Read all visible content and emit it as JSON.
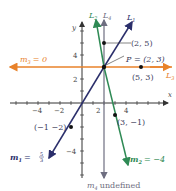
{
  "axes": {
    "x_label": "x",
    "y_label": "y",
    "x_ticks": [
      {
        "value": -4,
        "label": "−4"
      },
      {
        "value": -2,
        "label": "−2"
      },
      {
        "value": 2,
        "label": "2"
      },
      {
        "value": 4,
        "label": "4"
      }
    ],
    "y_ticks": [
      {
        "value": 4,
        "label": "4"
      },
      {
        "value": 2,
        "label": "2"
      },
      {
        "value": -4,
        "label": "−4"
      }
    ]
  },
  "lines": {
    "L1": {
      "name": "L",
      "sub": "1",
      "color": "#2b2f6b",
      "slope_label": "m",
      "slope_sub": "1",
      "slope_value": "= 5/3",
      "slope_num": "5",
      "slope_den": "3"
    },
    "L2": {
      "name": "L",
      "sub": "2",
      "color": "#2f8a55",
      "slope_label": "m",
      "slope_sub": "2",
      "slope_value": "= −4"
    },
    "L3": {
      "name": "L",
      "sub": "3",
      "color": "#e8822a",
      "slope_label": "m",
      "slope_sub": "3",
      "slope_value": "= 0"
    },
    "L4": {
      "name": "L",
      "sub": "4",
      "color": "#6e6e80",
      "slope_label": "m",
      "slope_sub": "4",
      "slope_value": "undefined"
    }
  },
  "points": {
    "P": {
      "label": "P = (2, 3)"
    },
    "p25": {
      "label": "(2, 5)"
    },
    "p53": {
      "label": "(5, 3)"
    },
    "pm1m2": {
      "label": "(−1 −2)"
    },
    "p3m1": {
      "label": "(3, −1)"
    }
  }
}
